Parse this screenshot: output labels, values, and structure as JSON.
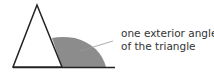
{
  "diagram": {
    "annotation": {
      "line1": "one exterior angle",
      "line2": "of the triangle"
    },
    "colors": {
      "stroke": "#222222",
      "shaded_angle": "#8c8c8c",
      "leader_line": "#999999",
      "text": "#333333"
    }
  }
}
